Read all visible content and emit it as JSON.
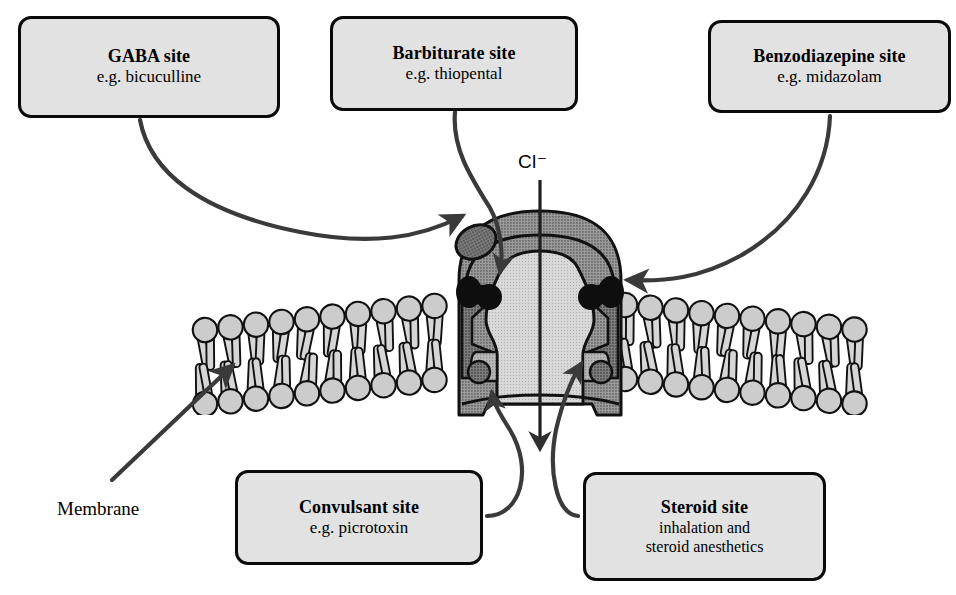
{
  "figure": {
    "canvas": {
      "width": 956,
      "height": 595,
      "background": "#ffffff"
    }
  },
  "colors": {
    "box_fill": "#e2e2e2",
    "box_border": "#0a0a0a",
    "connector": "#3a3a3a",
    "lipid_head_fill": "#cccccc",
    "lipid_tail_fill": "#d6d6d6",
    "lipid_outline": "#111111",
    "receptor_outer": "#9a9a9a",
    "receptor_mid": "#8a8a8a",
    "receptor_inner": "#b0b0b0",
    "receptor_dark": "#6d6d6d",
    "receptor_black": "#111111"
  },
  "labels": {
    "gaba": {
      "title": "GABA site",
      "subtitle": "e.g. bicuculline"
    },
    "barbiturate": {
      "title": "Barbiturate site",
      "subtitle": "e.g. thiopental"
    },
    "benzodiazepine": {
      "title": "Benzodiazepine site",
      "subtitle": "e.g. midazolam"
    },
    "convulsant": {
      "title": "Convulsant site",
      "subtitle": "e.g. picrotoxin"
    },
    "steroid": {
      "title": "Steroid site",
      "subtitle_line1": "inhalation and",
      "subtitle_line2": "steroid anesthetics"
    }
  },
  "annotations": {
    "membrane": "Membrane",
    "chloride_ion": "Cl⁻"
  },
  "structure": {
    "ion_channel_name": "chloride channel",
    "flow_direction": "downward through pore",
    "membrane_type": "phospholipid bilayer"
  }
}
